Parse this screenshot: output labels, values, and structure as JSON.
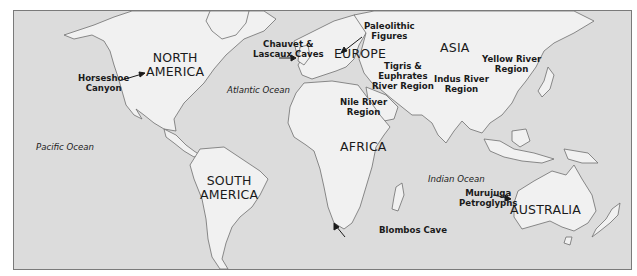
{
  "map": {
    "title": "Early Art Sites World Map",
    "colors": {
      "ocean": "#dcdcdc",
      "land": "#f1f1f1",
      "coast": "#6e6e6e",
      "frame": "#7a7a7a",
      "text": "#1a1a1a"
    },
    "continents": [
      {
        "id": "north-america",
        "line1": "NORTH",
        "line2": "AMERICA"
      },
      {
        "id": "south-america",
        "line1": "SOUTH",
        "line2": "AMERICA"
      },
      {
        "id": "europe",
        "line1": "EUROPE",
        "line2": ""
      },
      {
        "id": "asia",
        "line1": "ASIA",
        "line2": ""
      },
      {
        "id": "africa",
        "line1": "AFRICA",
        "line2": ""
      },
      {
        "id": "australia",
        "line1": "AUSTRALIA",
        "line2": ""
      }
    ],
    "oceans": [
      {
        "id": "atlantic",
        "label": "Atlantic Ocean"
      },
      {
        "id": "pacific",
        "label": "Pacific Ocean"
      },
      {
        "id": "indian",
        "label": "Indian Ocean"
      }
    ],
    "sites": [
      {
        "id": "horseshoe-canyon",
        "line1": "Horseshoe",
        "line2": "Canyon"
      },
      {
        "id": "chauvet-lascaux",
        "line1": "Chauvet &",
        "line2": "Lascaux Caves"
      },
      {
        "id": "paleolithic-figures",
        "line1": "Paleolithic",
        "line2": "Figures"
      },
      {
        "id": "tigris-euphrates",
        "line1": "Tigris &",
        "line2": "Euphrates",
        "line3": "River Region"
      },
      {
        "id": "indus",
        "line1": "Indus River",
        "line2": "Region"
      },
      {
        "id": "yellow-river",
        "line1": "Yellow River",
        "line2": "Region"
      },
      {
        "id": "nile",
        "line1": "Nile River",
        "line2": "Region"
      },
      {
        "id": "blombos",
        "line1": "Blombos Cave"
      },
      {
        "id": "murujuga",
        "line1": "Murujuga",
        "line2": "Petroglyphs"
      }
    ]
  }
}
